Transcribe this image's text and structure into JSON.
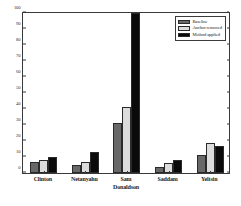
{
  "chart_data": {
    "type": "bar",
    "title": "",
    "xlabel": "",
    "ylabel": "",
    "ylim": [
      0,
      100
    ],
    "yticks": [
      0,
      10,
      20,
      30,
      40,
      50,
      60,
      70,
      80,
      90,
      100
    ],
    "grid": false,
    "legend_position": "top-right",
    "categories": [
      "Clinton",
      "Netanyahu",
      "Sam\nDonaldson",
      "Saddam",
      "Yeltsin"
    ],
    "series": [
      {
        "name": "Baseline",
        "color": "#686868",
        "values": [
          7,
          5,
          31,
          4,
          11
        ]
      },
      {
        "name": "Anchor removed",
        "color": "#dcdcdc",
        "values": [
          8,
          7,
          41,
          6,
          19
        ]
      },
      {
        "name": "Method applied",
        "color": "#0a0a0a",
        "values": [
          10,
          13,
          100,
          8,
          17
        ]
      }
    ]
  }
}
